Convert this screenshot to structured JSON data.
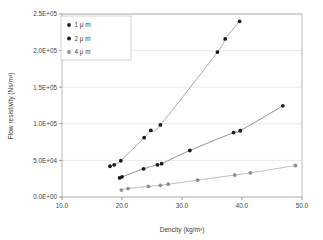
{
  "chart_data": {
    "type": "scatter",
    "title": "",
    "xlabel": "Dencity (kg/m³)",
    "ylabel": "Flow resistivity (Ns/m³)",
    "xlim": [
      10.0,
      50.0
    ],
    "ylim": [
      0,
      250000
    ],
    "xticks": [
      "10.0",
      "20.0",
      "30.0",
      "40.0",
      "50.0"
    ],
    "xtick_values": [
      10.0,
      20.0,
      30.0,
      40.0,
      50.0
    ],
    "yticks": [
      "0.0E+00",
      "5.0E+04",
      "1.0E+05",
      "1.5E+05",
      "2.0E+05",
      "2.5E+05"
    ],
    "ytick_values": [
      0,
      50000,
      100000,
      150000,
      200000,
      250000
    ],
    "grid": "horizontal",
    "legend_position": "top-left",
    "series": [
      {
        "name": "1 μ m",
        "color": "#1a1a1a",
        "line_color": "#8c8c8c",
        "marker": "circle",
        "points": [
          [
            18.0,
            42000
          ],
          [
            18.7,
            44000
          ],
          [
            19.8,
            49500
          ],
          [
            23.7,
            81000
          ],
          [
            24.8,
            91000
          ],
          [
            26.4,
            98500
          ],
          [
            35.9,
            198000
          ],
          [
            37.2,
            216000
          ],
          [
            39.6,
            240000
          ]
        ]
      },
      {
        "name": "2 μ m",
        "color": "#1a1a1a",
        "line_color": "#6e6e6e",
        "marker": "circle",
        "points": [
          [
            19.6,
            26000
          ],
          [
            20.0,
            27500
          ],
          [
            23.6,
            38500
          ],
          [
            25.9,
            44000
          ],
          [
            26.6,
            45500
          ],
          [
            31.3,
            63500
          ],
          [
            38.6,
            88000
          ],
          [
            39.7,
            90500
          ],
          [
            46.8,
            124500
          ]
        ]
      },
      {
        "name": "4 μ m",
        "color": "#8f8f8f",
        "line_color": "#a8a8a8",
        "marker": "circle",
        "points": [
          [
            19.9,
            9500
          ],
          [
            21.0,
            11500
          ],
          [
            24.4,
            14500
          ],
          [
            26.4,
            16000
          ],
          [
            27.7,
            17500
          ],
          [
            32.6,
            23000
          ],
          [
            38.8,
            30000
          ],
          [
            41.4,
            33000
          ],
          [
            48.9,
            43000
          ]
        ]
      }
    ]
  },
  "legend": {
    "entries": [
      {
        "label": "1 μ m"
      },
      {
        "label": "2 μ m"
      },
      {
        "label": "4 μ m"
      }
    ]
  },
  "colors": {
    "dark_marker": "#1a1a1a",
    "gray_marker": "#8f8f8f",
    "grid": "#d9d9d9",
    "frame": "#9a9a9a",
    "background": "#ffffff"
  }
}
